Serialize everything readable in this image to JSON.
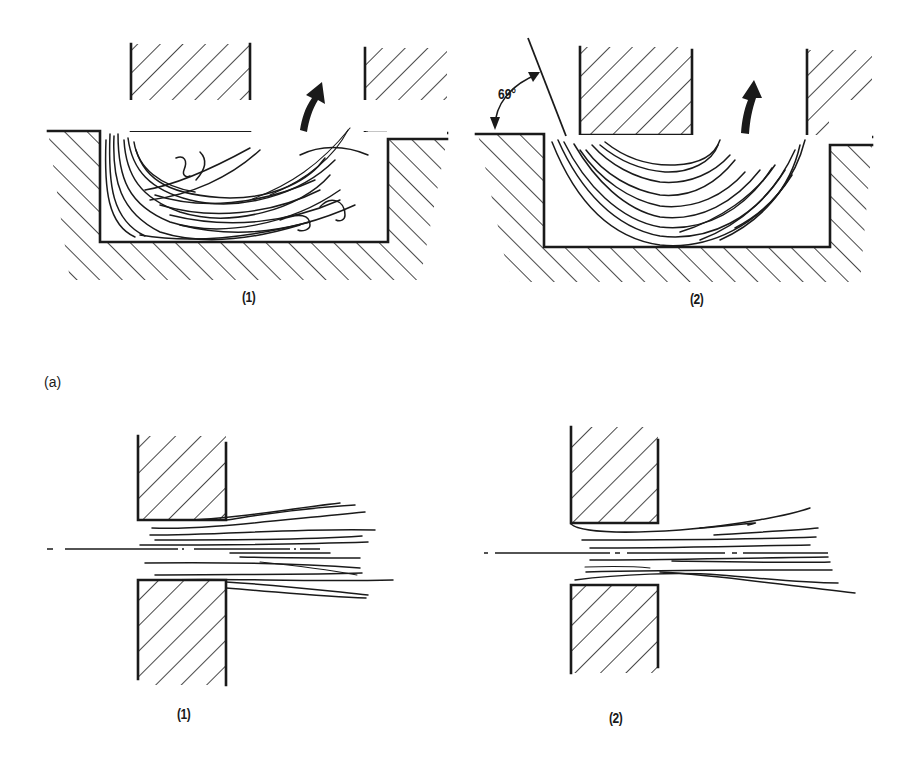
{
  "figure": {
    "part_label": "(a)",
    "panels": [
      {
        "id": "top-1",
        "label": "(1)",
        "description": "Deep-drawing / extrusion cavity: metal flow lines curl into vortices near the punch corner; curved arrow shows upward metal flow toward gap between punch and die"
      },
      {
        "id": "top-2",
        "label": "(2)",
        "description": "Cavity with inclined entry wall; flow lines form smooth U-shaped curves; curved arrow shows upward flow",
        "angle_annotation": "69°"
      },
      {
        "id": "bottom-1",
        "label": "(1)",
        "description": "Shearing between square-edged blades; flow lines fan out downstream of blade gap, dash-dot centerline"
      },
      {
        "id": "bottom-2",
        "label": "(2)",
        "description": "Shearing between blades with rounded upper edge; flow lines fan out downstream, dash-dot centerline"
      }
    ]
  },
  "colors": {
    "ink": "#1a1a1a",
    "paper": "#ffffff"
  }
}
